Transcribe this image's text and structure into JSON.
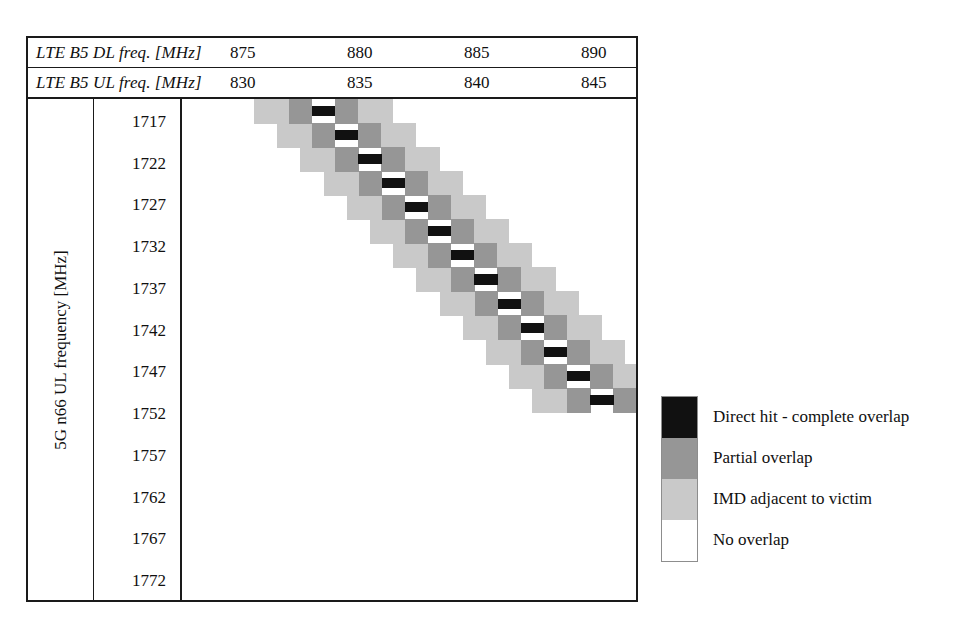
{
  "figure": {
    "header_rows": [
      {
        "label": "LTE B5 DL freq. [MHz]",
        "ticks": [
          "875",
          "880",
          "885",
          "890"
        ]
      },
      {
        "label": "LTE B5 UL freq. [MHz]",
        "ticks": [
          "830",
          "835",
          "840",
          "845"
        ]
      }
    ],
    "y_axis_title": "5G n66 UL frequency [MHz]",
    "y_ticks": [
      "1717",
      "1722",
      "1727",
      "1732",
      "1737",
      "1742",
      "1747",
      "1752",
      "1757",
      "1762",
      "1767",
      "1772"
    ]
  },
  "legend": {
    "items": [
      {
        "label": "Direct hit - complete overlap",
        "color": "#111111",
        "key": "direct-hit"
      },
      {
        "label": "Partial overlap",
        "color": "#969696",
        "key": "partial-overlap"
      },
      {
        "label": "IMD adjacent to victim",
        "color": "#c9c9c9",
        "key": "imd-adjacent"
      },
      {
        "label": "No overlap",
        "color": "#ffffff",
        "key": "no-overlap"
      }
    ]
  },
  "chart_data": {
    "type": "heatmap",
    "title": "",
    "xlabel": "LTE B5 DL freq. [MHz] / LTE B5 UL freq. [MHz]",
    "ylabel": "5G n66 UL frequency [MHz]",
    "x_tick_labels_dl": [
      "875",
      "880",
      "885",
      "890"
    ],
    "x_tick_labels_ul": [
      "830",
      "835",
      "840",
      "845"
    ],
    "x_range_dl": [
      873.8,
      893.0
    ],
    "y_tick_labels": [
      "1717",
      "1722",
      "1727",
      "1732",
      "1737",
      "1742",
      "1747",
      "1752",
      "1757",
      "1762",
      "1767",
      "1772"
    ],
    "y_range": [
      1715.6,
      1773.8
    ],
    "grid": false,
    "legend_position": "right-outside",
    "category_levels": [
      "No overlap",
      "IMD adjacent to victim",
      "Partial overlap",
      "Direct hit - complete overlap"
    ],
    "category_colors": [
      "#ffffff",
      "#c9c9c9",
      "#969696",
      "#111111"
    ],
    "note": "Anti-diagonal band: each successive 5G n66 UL row shifts the overlap band to higher LTE B5 frequency. Band widths per row: 2 light cells, 1 mid cell, 1 black cell, 1 mid cell, 2 light cells.",
    "cell_width_mhz": 1.0,
    "cell_height_mhz": 2.42,
    "rows": [
      {
        "y_center": 1716.8,
        "direct_hit_x": 879.7
      },
      {
        "y_center": 1719.2,
        "direct_hit_x": 880.7
      },
      {
        "y_center": 1721.6,
        "direct_hit_x": 881.7
      },
      {
        "y_center": 1724.0,
        "direct_hit_x": 882.7
      },
      {
        "y_center": 1726.4,
        "direct_hit_x": 883.7
      },
      {
        "y_center": 1728.9,
        "direct_hit_x": 884.7
      },
      {
        "y_center": 1731.3,
        "direct_hit_x": 885.7
      },
      {
        "y_center": 1733.7,
        "direct_hit_x": 886.7
      },
      {
        "y_center": 1736.1,
        "direct_hit_x": 887.7
      },
      {
        "y_center": 1738.5,
        "direct_hit_x": 888.7
      },
      {
        "y_center": 1740.9,
        "direct_hit_x": 889.7
      },
      {
        "y_center": 1743.4,
        "direct_hit_x": 890.7
      },
      {
        "y_center": 1745.8,
        "direct_hit_x": 891.7
      }
    ]
  },
  "geometry": {
    "plot_px": {
      "width": 456,
      "height": 501
    },
    "cell_px": {
      "w": 23.2,
      "h": 24.1
    },
    "first_row_top_px": 0,
    "first_black_left_px": 130,
    "band_offsets": [
      -58,
      -35,
      -23,
      0,
      23,
      35,
      58
    ],
    "band_kinds": [
      "light",
      "light",
      "mid",
      "black",
      "mid",
      "light",
      "light"
    ]
  }
}
